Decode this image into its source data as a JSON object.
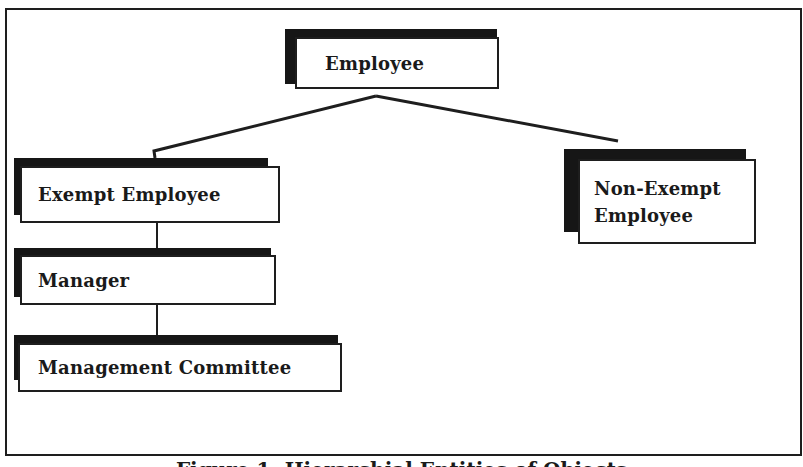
{
  "diagram": {
    "root": {
      "id": "employee",
      "label": "Employee"
    },
    "children": [
      {
        "id": "exempt-employee",
        "label": "Exempt Employee"
      },
      {
        "id": "non-exempt-employee",
        "label_line1": "Non-Exempt",
        "label_line2": "Employee"
      }
    ],
    "exempt_chain": [
      {
        "id": "manager",
        "label": "Manager"
      },
      {
        "id": "management-committee",
        "label": "Management Committee"
      }
    ],
    "edges": [
      {
        "from": "employee",
        "to": "exempt-employee"
      },
      {
        "from": "employee",
        "to": "non-exempt-employee"
      },
      {
        "from": "exempt-employee",
        "to": "manager"
      },
      {
        "from": "manager",
        "to": "management-committee"
      }
    ],
    "caption": "Figure 1: Hierarchial Entities of Objects"
  },
  "colors": {
    "ink": "#1e1e1e",
    "shadow": "#161616",
    "background": "#ffffff"
  }
}
